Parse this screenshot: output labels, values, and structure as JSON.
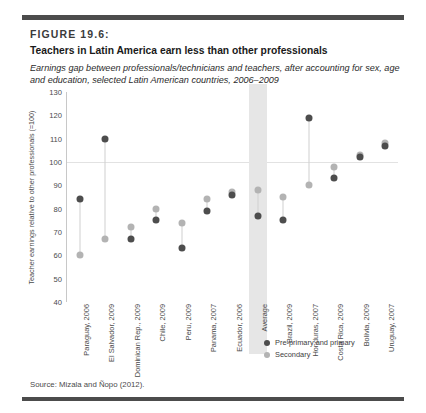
{
  "figure": {
    "number": "FIGURE 19.6:",
    "title": "Teachers in Latin America earn less than other professionals",
    "subtitle": "Earnings gap between professionals/technicians and teachers, after accounting for sex, age and education, selected Latin American countries, 2006–2009",
    "source": "Source: Mizala and Ñopo (2012)."
  },
  "colors": {
    "primary": "#4d4d4d",
    "secondary": "#b3b3b3",
    "band": "#e6e6e6",
    "rule": "#4c4c4c",
    "grid": "#e2e2e2"
  },
  "chart_data": {
    "type": "scatter",
    "title": "Teachers in Latin America earn less than other professionals",
    "xlabel": "",
    "ylabel": "Teacher earnings relative to other professionals (=100)",
    "ylim": [
      40,
      130
    ],
    "yticks": [
      40,
      50,
      60,
      70,
      80,
      90,
      100,
      110,
      120,
      130
    ],
    "grid": true,
    "reference_line": 100,
    "highlight_category": "Average",
    "legend_position": "inside-right",
    "categories": [
      "Paraguay, 2006",
      "El Salvador, 2009",
      "Dominican Rep., 2009",
      "Chile, 2009",
      "Peru, 2009",
      "Panama, 2007",
      "Ecuador, 2006",
      "Average",
      "Brazil, 2009",
      "Honduras, 2007",
      "Costa Rica, 2009",
      "Bolivia, 2009",
      "Uruguay, 2007"
    ],
    "series": [
      {
        "name": "Pre-primary and primary",
        "color": "#4d4d4d",
        "values": [
          84,
          110,
          67,
          75,
          63,
          79,
          86,
          77,
          75,
          119,
          93,
          102,
          107
        ]
      },
      {
        "name": "Secondary",
        "color": "#b3b3b3",
        "values": [
          60,
          67,
          72,
          80,
          74,
          84,
          87,
          88,
          85,
          90,
          98,
          103,
          108
        ]
      }
    ]
  },
  "legend": [
    {
      "label": "Pre-primary and primary",
      "marker": "dot-dark"
    },
    {
      "label": "Secondary",
      "marker": "dot-light"
    }
  ]
}
